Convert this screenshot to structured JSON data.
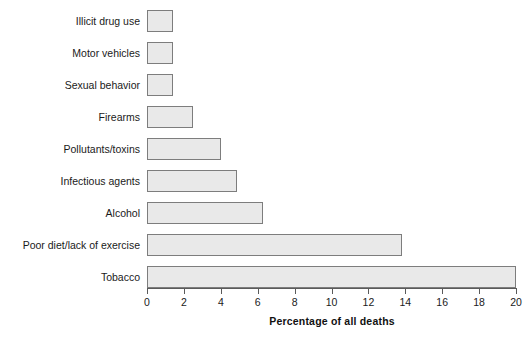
{
  "chart_data": {
    "type": "bar",
    "orientation": "horizontal",
    "title": "",
    "subtitle": "",
    "xlabel": "Percentage of all deaths",
    "ylabel": "",
    "xlim": [
      0,
      20
    ],
    "xticks": [
      0,
      2,
      4,
      6,
      8,
      10,
      12,
      14,
      16,
      18,
      20
    ],
    "xtick_labels": [
      "0",
      "2",
      "4",
      "6",
      "8",
      "10",
      "12",
      "14",
      "16",
      "18",
      "20"
    ],
    "grid": false,
    "legend": null,
    "categories": [
      "Illicit drug use",
      "Motor vehicles",
      "Sexual behavior",
      "Firearms",
      "Pollutants/toxins",
      "Infectious agents",
      "Alcohol",
      "Poor diet/lack of exercise",
      "Tobacco"
    ],
    "values": [
      1.4,
      1.4,
      1.4,
      2.5,
      4.0,
      4.9,
      6.3,
      13.8,
      20.0
    ],
    "bar_fill_color": "#e9e9e9",
    "bar_border_color": "#7d7d7d",
    "axis_color": "#5a5a5a",
    "background_color": "#ffffff"
  }
}
